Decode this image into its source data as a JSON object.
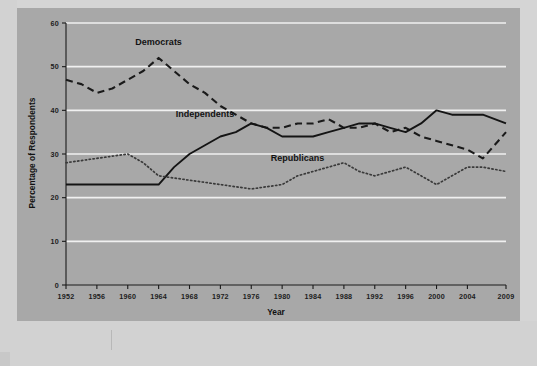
{
  "chart_data": {
    "type": "line",
    "title": "",
    "subtitle": "",
    "xlabel": "Year",
    "ylabel": "Percentage of Respondents",
    "xlim": [
      1952,
      2009
    ],
    "ylim": [
      0,
      60
    ],
    "grid": true,
    "grid_axis": "y",
    "legend_position": "inline-annotations",
    "x_tick_labels": [
      "1952",
      "1956",
      "1960",
      "1964",
      "1968",
      "1972",
      "1976",
      "1980",
      "1984",
      "1988",
      "1992",
      "1996",
      "2000",
      "2004",
      "2009"
    ],
    "y_tick_labels": [
      "0",
      "10",
      "20",
      "30",
      "40",
      "50",
      "60"
    ],
    "x": [
      1952,
      1954,
      1956,
      1958,
      1960,
      1962,
      1964,
      1966,
      1968,
      1970,
      1972,
      1974,
      1976,
      1978,
      1980,
      1982,
      1984,
      1986,
      1988,
      1990,
      1992,
      1994,
      1996,
      1998,
      2000,
      2002,
      2004,
      2006,
      2009
    ],
    "series": [
      {
        "name": "Democrats",
        "style": "dashed",
        "color": "#1a1a1a",
        "values": [
          47,
          46,
          44,
          45,
          47,
          49,
          52,
          49,
          46,
          44,
          41,
          39,
          37,
          36,
          36,
          37,
          37,
          38,
          36,
          36,
          37,
          35,
          36,
          34,
          33,
          32,
          31,
          29,
          35
        ]
      },
      {
        "name": "Independents",
        "style": "solid",
        "color": "#141414",
        "values": [
          23,
          23,
          23,
          23,
          23,
          23,
          23,
          27,
          30,
          32,
          34,
          35,
          37,
          36,
          34,
          34,
          34,
          35,
          36,
          37,
          37,
          36,
          35,
          37,
          40,
          39,
          39,
          39,
          37
        ]
      },
      {
        "name": "Republicans",
        "style": "dotted",
        "color": "#3a3a3a",
        "values": [
          28,
          28.5,
          29,
          29.5,
          30,
          28,
          25,
          24.5,
          24,
          23.5,
          23,
          22.5,
          22,
          22.5,
          23,
          25,
          26,
          27,
          28,
          26,
          25,
          26,
          27,
          25,
          23,
          25,
          27,
          27,
          26
        ]
      }
    ],
    "annotations": [
      {
        "text": "Democrats",
        "x": 1964,
        "y": 55
      },
      {
        "text": "Independents",
        "x": 1970,
        "y": 38.5
      },
      {
        "text": "Republicans",
        "x": 1982,
        "y": 28.5
      }
    ]
  },
  "axes": {
    "x_title": "Year",
    "y_title": "Percentage of Respondents"
  },
  "colors": {
    "figure_background": "#a8a8a8",
    "page_background": "#d5d5d5",
    "gridline": "#f0f0f0",
    "axis": "#1a1a1a",
    "text": "#141414"
  }
}
